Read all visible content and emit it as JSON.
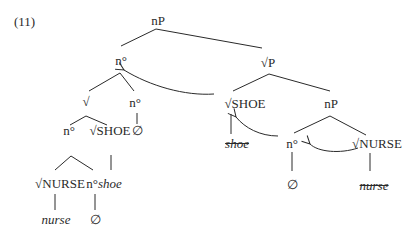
{
  "example_number": "(11)",
  "tree": {
    "root": "nP",
    "left": {
      "head": "n°",
      "root_node": "√",
      "n_label": "n°",
      "n_label_null": "∅",
      "inner_n": "n°",
      "inner_root": "√SHOE",
      "nurse_root": "√NURSE",
      "n_shoe_prefix": "n°",
      "n_shoe_suffix": "shoe",
      "nurse_leaf": "nurse",
      "null_leaf": "∅"
    },
    "right": {
      "rootP": "√P",
      "shoe_root": "√SHOE",
      "shoe_leaf_struck": "shoe",
      "inner_nP": "nP",
      "inner_n": "n°",
      "inner_n_null": "∅",
      "nurse_root": "√NURSE",
      "nurse_leaf_struck": "nurse"
    }
  },
  "colors": {
    "ink": "#2a2a2a"
  }
}
